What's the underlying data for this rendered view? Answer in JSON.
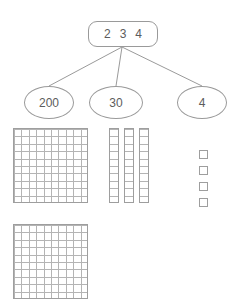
{
  "diagram": {
    "title_number": "234",
    "root": {
      "label": "2 3 4",
      "digits": [
        "2",
        "3",
        "4"
      ]
    },
    "parts": [
      {
        "label": "200",
        "place": "hundreds"
      },
      {
        "label": "30",
        "place": "tens"
      },
      {
        "label": "4",
        "place": "ones"
      }
    ],
    "blocks": {
      "hundreds_flats": 2,
      "tens_rods": 3,
      "ones_units": 4,
      "flat_rows": 10,
      "flat_cols": 10,
      "rod_cells": 10
    },
    "colors": {
      "outline": "#9a9a9a",
      "grid_line": "#b4b4b4",
      "block_border": "#9e9e9e",
      "text": "#5c5c5c",
      "background": "#ffffff"
    }
  }
}
